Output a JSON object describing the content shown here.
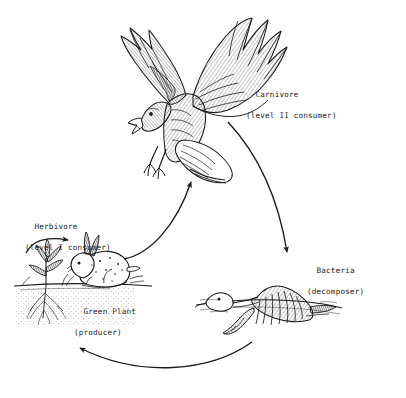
{
  "diagram": {
    "type": "food-chain-cycle",
    "background_color": "#ffffff",
    "ink_color": "#1a1a1a",
    "style": "pen-and-ink crosshatch line drawing"
  },
  "labels": {
    "carnivore": {
      "line1": "Carnivore",
      "line2": "(level II consumer)"
    },
    "herbivore": {
      "line1": "Herbivore",
      "line2": "(level I consumer)"
    },
    "green_plant": {
      "line1": "Green Plant",
      "line2": "(producer)"
    },
    "bacteria": {
      "line1": "Bacteria",
      "line2": "(decomposer)"
    }
  },
  "organisms": [
    {
      "name": "hawk",
      "role": "carnivore",
      "label": "Carnivore"
    },
    {
      "name": "rabbit",
      "role": "herbivore",
      "label": "Herbivore"
    },
    {
      "name": "plant",
      "role": "producer",
      "label": "Green Plant"
    },
    {
      "name": "carcass",
      "role": "decomposer",
      "label": "Bacteria"
    }
  ],
  "arrows": [
    {
      "name": "plant-to-rabbit",
      "from": "plant",
      "to": "rabbit"
    },
    {
      "name": "rabbit-to-hawk",
      "from": "rabbit",
      "to": "hawk"
    },
    {
      "name": "hawk-to-bacteria",
      "from": "hawk",
      "to": "bacteria"
    },
    {
      "name": "bacteria-to-plant",
      "from": "bacteria",
      "to": "plant"
    }
  ]
}
